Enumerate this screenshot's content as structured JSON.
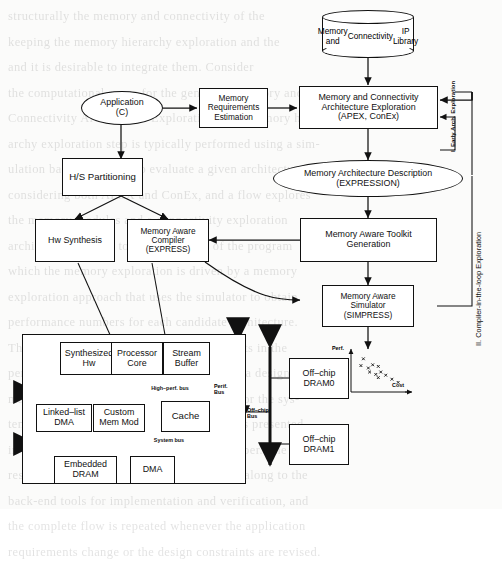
{
  "figure": {
    "phases": [
      {
        "id": "phase-1",
        "label": "I. Early Arch. Exploration"
      },
      {
        "id": "phase-2",
        "label": "II. Compiler-in-the-loop Exploration"
      }
    ],
    "nodes": [
      {
        "id": "ip-library",
        "shape": "cylinder",
        "lines": [
          "Memory and",
          "Connectivity",
          "IP Library"
        ]
      },
      {
        "id": "application",
        "shape": "ellipse",
        "lines": [
          "Application",
          "(C)"
        ]
      },
      {
        "id": "mem-req-est",
        "shape": "box",
        "lines": [
          "Memory",
          "Requirements",
          "Estimation"
        ]
      },
      {
        "id": "apex-conex",
        "shape": "box",
        "lines": [
          "Memory and Connectivity",
          "Architecture Exploration",
          "(APEX, ConEx)"
        ]
      },
      {
        "id": "hs-part",
        "shape": "box",
        "lines": [
          "H/S Partitioning"
        ]
      },
      {
        "id": "mem-arch-desc",
        "shape": "ellipse",
        "lines": [
          "Memory Architecture Description",
          "(EXPRESSION)"
        ]
      },
      {
        "id": "hw-synth",
        "shape": "box",
        "lines": [
          "Hw Synthesis"
        ]
      },
      {
        "id": "mem-compiler",
        "shape": "box",
        "lines": [
          "Memory Aware",
          "Compiler",
          "(EXPRESS)"
        ]
      },
      {
        "id": "toolkit-gen",
        "shape": "box",
        "lines": [
          "Memory Aware Toolkit",
          "Generation"
        ]
      },
      {
        "id": "simulator",
        "shape": "box",
        "lines": [
          "Memory Aware",
          "Simulator",
          "(SIMPRESS)"
        ]
      }
    ],
    "system_block": {
      "id": "system-on-chip",
      "components": [
        {
          "id": "synthesized-hw",
          "lines": [
            "Synthesized",
            "Hw"
          ]
        },
        {
          "id": "processor-core",
          "lines": [
            "Processor",
            "Core"
          ]
        },
        {
          "id": "stream-buffer",
          "lines": [
            "Stream",
            "Buffer"
          ]
        },
        {
          "id": "linked-list-dma",
          "lines": [
            "Linked–list",
            "DMA"
          ]
        },
        {
          "id": "custom-mem-mod",
          "lines": [
            "Custom",
            "Mem Mod"
          ]
        },
        {
          "id": "cache",
          "lines": [
            "Cache"
          ]
        },
        {
          "id": "embedded-dram",
          "lines": [
            "Embedded",
            "DRAM"
          ]
        },
        {
          "id": "dma",
          "lines": [
            "DMA"
          ]
        }
      ],
      "buses": [
        {
          "id": "high-perf-bus",
          "label": "High–perf. bus"
        },
        {
          "id": "system-bus",
          "label": "System bus"
        },
        {
          "id": "perif-bus",
          "label": "Perif.\nBus",
          "line1": "Perif.",
          "line2": "Bus"
        },
        {
          "id": "off-chip-bus",
          "label": "Off–chip\nBus",
          "line1": "Off–chip",
          "line2": "Bus"
        }
      ],
      "off_chip": [
        {
          "id": "off-chip-dram0",
          "lines": [
            "Off–chip",
            "DRAM0"
          ]
        },
        {
          "id": "off-chip-dram1",
          "lines": [
            "Off–chip",
            "DRAM1"
          ]
        }
      ]
    },
    "chart_data": {
      "type": "scatter",
      "title": "",
      "xlabel": "Cost",
      "ylabel": "Perf.",
      "grid": false,
      "legend": "none",
      "xlim": [
        0,
        10
      ],
      "ylim": [
        0,
        10
      ],
      "points": [
        {
          "x": 2.0,
          "y": 8.3
        },
        {
          "x": 1.6,
          "y": 6.6
        },
        {
          "x": 2.8,
          "y": 6.0
        },
        {
          "x": 3.5,
          "y": 6.8
        },
        {
          "x": 4.4,
          "y": 6.4
        },
        {
          "x": 3.0,
          "y": 5.0
        },
        {
          "x": 4.0,
          "y": 4.4
        },
        {
          "x": 4.8,
          "y": 5.0
        },
        {
          "x": 4.4,
          "y": 3.6
        },
        {
          "x": 5.6,
          "y": 4.2
        },
        {
          "x": 6.6,
          "y": 3.2
        },
        {
          "x": 7.6,
          "y": 2.4
        }
      ]
    }
  },
  "page_bleed": [
    "structurally         the memory and connectivity of the",
    "keeping the memory hierarchy   exploration and the",
    "and it  is   desirable to   integrate   them. Consider",
    "the computational  space for  the  generated  memory and",
    "Connectivity  Architecture  Exploration for a  memory hier-",
    "archy exploration step is typically performed using a sim-",
    "ulation based approach  to evaluate a  given architecture",
    "considering  both  APEX  and  ConEx,  and a  flow  explores",
    "the  memory  modules  and  a  connectivity  exploration",
    "architecture   leading  to   the  simulation   of  the  program",
    "which  the   memory   exploration   is   driven   by  a  memory",
    "exploration  approach  that  uses  the  simulator  to  obtain",
    "performance   numbers   for   each   candidate   architecture.",
    "The  outcome  is  a  set  of  Pareto-optimal  points  in  the",
    "performance/cost  design  space,  from  which  a  designer",
    "may  select  a  suitable  memory  architecture  for  the  sys-",
    "tem.  This  design  exploration  methodology  is  presented",
    "in  detail  in  the  following  sections  of  this  paper.  The",
    "resulting  memory  subsystem  is  then  passed  along  to  the",
    "back-end  tools  for  implementation  and  verification,  and",
    "the  complete  flow  is  repeated  whenever  the  application",
    "requirements change or the design constraints are revised."
  ]
}
